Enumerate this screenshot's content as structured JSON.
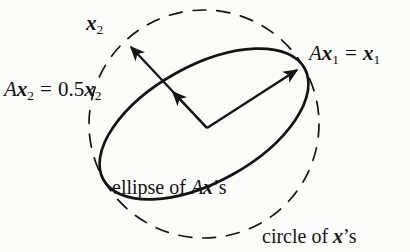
{
  "figure": {
    "background_color": "#fbfbfa",
    "ink_color": "#141414"
  },
  "labels": {
    "x2": {
      "vector": "x",
      "subscript": "2"
    },
    "ax2": {
      "matrix": "A",
      "vector": "x",
      "subscript": "2",
      "equals": "=",
      "scalar": "0.5",
      "result_vector": "x",
      "result_subscript": "2"
    },
    "ax1": {
      "matrix": "A",
      "vector": "x",
      "subscript": "1",
      "equals": "=",
      "result_vector": "x",
      "result_subscript": "1"
    },
    "ellipse_caption": {
      "prefix": "ellipse of ",
      "matrix": "A",
      "vector": "x",
      "suffix": "’s"
    },
    "circle_caption": {
      "prefix": "circle of ",
      "vector": "x",
      "suffix": "’s"
    }
  },
  "shapes": {
    "circle": {
      "name": "circle of x's",
      "style": "dashed",
      "center": [
        204,
        124
      ],
      "radius": 115,
      "stroke": "#141414",
      "stroke_width": 1.7,
      "dash": "13 11"
    },
    "ellipse": {
      "name": "ellipse of Ax's",
      "style": "solid",
      "center": [
        204,
        124
      ],
      "semi_major": 115,
      "semi_minor": 58,
      "rotation_deg": -29,
      "stroke": "#141414",
      "stroke_width": 2.6
    },
    "origin": [
      207,
      128
    ]
  },
  "vectors": [
    {
      "name": "x2",
      "description": "unit eigenvector x2 reaching the dashed circle",
      "from": [
        207,
        128
      ],
      "to": [
        128,
        44
      ],
      "arrowhead": true
    },
    {
      "name": "Ax2",
      "description": "scaled eigenvector 0.5 x2 reaching the ellipse",
      "from": [
        207,
        128
      ],
      "to": [
        170,
        90
      ],
      "arrowhead": true
    },
    {
      "name": "Ax1",
      "description": "eigenvector x1 unchanged, touching circle and ellipse",
      "from": [
        207,
        128
      ],
      "to": [
        300,
        67
      ],
      "arrowhead": true
    }
  ]
}
